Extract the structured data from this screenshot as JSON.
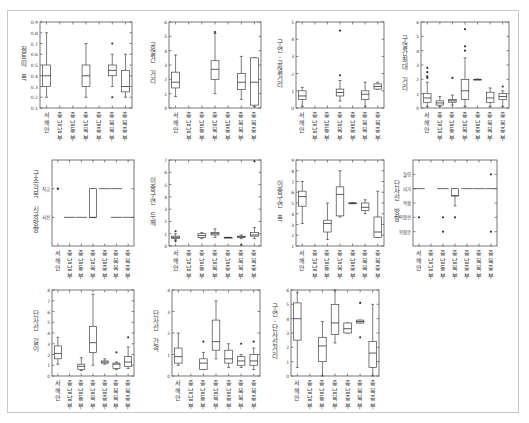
{
  "categories": [
    "서해안",
    "충남남부",
    "충남동부",
    "충남북부",
    "충남중부",
    "충북북부",
    "충북중부"
  ],
  "chart_data": [
    {
      "type": "box",
      "id": "p1",
      "ylabel": "점토띠 폭",
      "ylim": [
        0.1,
        0.9
      ],
      "yticks": [
        0.1,
        0.2,
        0.3,
        0.4,
        0.5,
        0.6,
        0.7,
        0.8,
        0.9
      ],
      "ytick_labels": [
        "0.1",
        "0.2",
        "0.3",
        "0.4",
        "0.5",
        "0.6",
        "0.7",
        "0.8",
        "0.9"
      ],
      "boxes": [
        {
          "cat": 0,
          "min": 0.2,
          "q1": 0.3,
          "med": 0.4,
          "q3": 0.5,
          "max": 0.8,
          "outliers": []
        },
        {
          "cat": 3,
          "min": 0.2,
          "q1": 0.3,
          "med": 0.4,
          "q3": 0.5,
          "max": 0.7,
          "outliers": []
        },
        {
          "cat": 5,
          "min": 0.3,
          "q1": 0.4,
          "med": 0.45,
          "q3": 0.5,
          "max": 0.6,
          "outliers": [
            0.7,
            0.2
          ]
        },
        {
          "cat": 6,
          "min": 0.2,
          "q1": 0.25,
          "med": 0.3,
          "q3": 0.45,
          "max": 0.6,
          "outliers": []
        }
      ]
    },
    {
      "type": "box",
      "id": "p2",
      "ylabel": "공열간 거리",
      "ylim": [
        0,
        6
      ],
      "yticks": [
        0,
        1,
        2,
        3,
        4,
        5,
        6
      ],
      "ytick_labels": [
        "0",
        "1",
        "2",
        "3",
        "4",
        "5",
        "6"
      ],
      "boxes": [
        {
          "cat": 0,
          "min": 0.8,
          "q1": 1.4,
          "med": 1.8,
          "q3": 2.5,
          "max": 3.7,
          "outliers": []
        },
        {
          "cat": 3,
          "min": 1.0,
          "q1": 2.0,
          "med": 2.7,
          "q3": 3.3,
          "max": 5.2,
          "outliers": [
            5.3
          ]
        },
        {
          "cat": 5,
          "min": 0.6,
          "q1": 1.3,
          "med": 1.8,
          "q3": 2.4,
          "max": 3.6,
          "outliers": []
        },
        {
          "cat": 6,
          "min": 0.1,
          "q1": 0.2,
          "med": 1.8,
          "q3": 3.5,
          "max": 3.5,
          "outliers": []
        }
      ]
    },
    {
      "type": "box",
      "id": "p3",
      "ylabel": "구연-공열거리",
      "ylim": [
        0,
        5
      ],
      "yticks": [
        0,
        1,
        2,
        3,
        4,
        5
      ],
      "ytick_labels": [
        "0",
        "1",
        "2",
        "3",
        "4",
        "5"
      ],
      "boxes": [
        {
          "cat": 0,
          "min": 0.1,
          "q1": 0.5,
          "med": 0.7,
          "q3": 1.0,
          "max": 1.2,
          "outliers": []
        },
        {
          "cat": 3,
          "min": 0.4,
          "q1": 0.7,
          "med": 0.9,
          "q3": 1.1,
          "max": 1.6,
          "outliers": [
            1.9,
            4.5
          ]
        },
        {
          "cat": 5,
          "min": 0.1,
          "q1": 0.5,
          "med": 0.8,
          "q3": 1.0,
          "max": 1.5,
          "outliers": []
        },
        {
          "cat": 6,
          "min": 1.1,
          "q1": 1.1,
          "med": 1.25,
          "q3": 1.4,
          "max": 1.5,
          "outliers": []
        }
      ]
    },
    {
      "type": "box",
      "id": "p4",
      "ylabel": "구열간최대 거리",
      "ylim": [
        0,
        6
      ],
      "yticks": [
        0,
        1,
        2,
        3,
        4,
        5,
        6
      ],
      "ytick_labels": [
        "0",
        "1",
        "2",
        "3",
        "4",
        "5",
        "6"
      ],
      "boxes": [
        {
          "cat": 0,
          "min": 0.1,
          "q1": 0.4,
          "med": 0.7,
          "q3": 1.0,
          "max": 1.8,
          "outliers": [
            2.1,
            2.2,
            2.5,
            2.8
          ]
        },
        {
          "cat": 1,
          "min": 0.1,
          "q1": 0.2,
          "med": 0.35,
          "q3": 0.5,
          "max": 0.8,
          "outliers": []
        },
        {
          "cat": 2,
          "min": 0.2,
          "q1": 0.4,
          "med": 0.5,
          "q3": 0.6,
          "max": 0.9,
          "outliers": [
            2.1
          ]
        },
        {
          "cat": 3,
          "min": 0.1,
          "q1": 0.6,
          "med": 1.2,
          "q3": 2.0,
          "max": 3.5,
          "outliers": [
            4.0,
            4.3,
            5.5
          ]
        },
        {
          "cat": 4,
          "min": 2.0,
          "q1": 2.0,
          "med": 2.0,
          "q3": 2.0,
          "max": 2.0,
          "outliers": []
        },
        {
          "cat": 5,
          "min": 0.1,
          "q1": 0.4,
          "med": 0.7,
          "q3": 1.1,
          "max": 1.4,
          "outliers": []
        },
        {
          "cat": 6,
          "min": 0.1,
          "q1": 0.6,
          "med": 0.8,
          "q3": 1.0,
          "max": 1.2,
          "outliers": [
            1.5
          ]
        }
      ]
    },
    {
      "type": "categorical-box",
      "id": "p5",
      "ylabel": "구조각목 시공방향",
      "ylim": [
        0,
        3
      ],
      "yticks": [
        1,
        2
      ],
      "ytick_labels": [
        "사선",
        "직교"
      ],
      "boxes": [
        {
          "cat": 0,
          "min": 2,
          "q1": 2,
          "med": 2,
          "q3": 2,
          "max": 2,
          "outliers": [],
          "point": true
        },
        {
          "cat": 1,
          "min": 1,
          "q1": 1,
          "med": 1,
          "q3": 1,
          "max": 1,
          "dash": true
        },
        {
          "cat": 2,
          "min": 1,
          "q1": 1,
          "med": 1,
          "q3": 1,
          "max": 1,
          "dash": true
        },
        {
          "cat": 3,
          "min": 1,
          "q1": 1,
          "med": 1,
          "q3": 2,
          "max": 2,
          "outliers": []
        },
        {
          "cat": 4,
          "min": 2,
          "q1": 2,
          "med": 2,
          "q3": 2,
          "max": 2,
          "dash": true
        },
        {
          "cat": 5,
          "min": 2,
          "q1": 2,
          "med": 2,
          "q3": 2,
          "max": 2,
          "dash": true
        },
        {
          "cat": 5,
          "min": 1,
          "q1": 1,
          "med": 1,
          "q3": 1,
          "max": 1,
          "dash": true
        },
        {
          "cat": 6,
          "min": 1,
          "q1": 1,
          "med": 1,
          "q3": 1,
          "max": 1,
          "dash": true
        }
      ]
    },
    {
      "type": "box",
      "id": "p6",
      "ylabel": "이중구연 두께",
      "ylim": [
        0,
        7
      ],
      "yticks": [
        0,
        1,
        2,
        3,
        4,
        5,
        6,
        7
      ],
      "ytick_labels": [
        "0",
        "1",
        "2",
        "3",
        "4",
        "5",
        "6",
        "7"
      ],
      "boxes": [
        {
          "cat": 0,
          "min": 0.5,
          "q1": 0.6,
          "med": 0.7,
          "q3": 0.8,
          "max": 1.0,
          "outliers": [
            1.2,
            0.4
          ]
        },
        {
          "cat": 2,
          "min": 0.6,
          "q1": 0.7,
          "med": 0.85,
          "q3": 1.0,
          "max": 1.1,
          "outliers": []
        },
        {
          "cat": 3,
          "min": 0.7,
          "q1": 0.9,
          "med": 1.0,
          "q3": 1.1,
          "max": 1.4,
          "outliers": []
        },
        {
          "cat": 4,
          "min": 0.7,
          "q1": 0.7,
          "med": 0.7,
          "q3": 0.7,
          "max": 0.7,
          "outliers": []
        },
        {
          "cat": 5,
          "min": 0.6,
          "q1": 0.7,
          "med": 0.75,
          "q3": 0.8,
          "max": 0.9,
          "outliers": [
            0.1
          ]
        },
        {
          "cat": 6,
          "min": 0.6,
          "q1": 0.8,
          "med": 0.9,
          "q3": 1.1,
          "max": 1.5,
          "outliers": [
            6.9
          ]
        }
      ]
    },
    {
      "type": "box",
      "id": "p7",
      "ylabel": "이중구연 폭",
      "ylim": [
        1,
        9
      ],
      "yticks": [
        1,
        2,
        3,
        4,
        5,
        6,
        7,
        8,
        9
      ],
      "ytick_labels": [
        "1",
        "2",
        "3",
        "4",
        "5",
        "6",
        "7",
        "8",
        "9"
      ],
      "boxes": [
        {
          "cat": 0,
          "min": 3.1,
          "q1": 4.7,
          "med": 5.6,
          "q3": 6.1,
          "max": 7.0,
          "outliers": []
        },
        {
          "cat": 2,
          "min": 1.6,
          "q1": 2.3,
          "med": 3.1,
          "q3": 3.4,
          "max": 5.0,
          "outliers": []
        },
        {
          "cat": 3,
          "min": 3.7,
          "q1": 3.8,
          "med": 5.8,
          "q3": 6.5,
          "max": 8.0,
          "outliers": []
        },
        {
          "cat": 4,
          "min": 5.0,
          "q1": 5.0,
          "med": 5.0,
          "q3": 5.0,
          "max": 5.0,
          "outliers": []
        },
        {
          "cat": 5,
          "min": 4.0,
          "q1": 4.3,
          "med": 4.6,
          "q3": 5.0,
          "max": 5.3,
          "outliers": []
        },
        {
          "cat": 6,
          "min": 1.8,
          "q1": 1.8,
          "med": 2.3,
          "q3": 3.7,
          "max": 6.1,
          "outliers": []
        }
      ]
    },
    {
      "type": "categorical-box",
      "id": "p8",
      "ylabel": "단사선 방향",
      "ylim": [
        0,
        6
      ],
      "yticks": [
        1,
        2,
        3,
        4,
        5
      ],
      "ytick_labels": [
        "복합분",
        "복합선",
        "복합",
        "이가",
        "돌림"
      ],
      "boxes": [
        {
          "cat": 0,
          "min": 4,
          "q1": 4,
          "med": 4,
          "q3": 4,
          "max": 4,
          "dash": true,
          "outliers": [
            2
          ]
        },
        {
          "cat": 2,
          "min": 4,
          "q1": 4,
          "med": 4,
          "q3": 4,
          "max": 4,
          "dash": true,
          "outliers": [
            2,
            1
          ]
        },
        {
          "cat": 3,
          "min": 2.8,
          "q1": 3.5,
          "med": 3.5,
          "q3": 4.0,
          "max": 4.0,
          "outliers": [
            2
          ]
        },
        {
          "cat": 4,
          "min": 4,
          "q1": 4,
          "med": 4,
          "q3": 4,
          "max": 4,
          "dash": true
        },
        {
          "cat": 5,
          "min": 4,
          "q1": 4,
          "med": 4,
          "q3": 4,
          "max": 4,
          "dash": true
        },
        {
          "cat": 6,
          "min": 4,
          "q1": 4,
          "med": 4,
          "q3": 4,
          "max": 4,
          "dash": true,
          "outliers": [
            5,
            1
          ]
        }
      ]
    },
    {
      "type": "box",
      "id": "p9",
      "ylabel": "단사선 길이",
      "ylim": [
        0,
        8
      ],
      "yticks": [
        0,
        1,
        2,
        3,
        4,
        5,
        6,
        7,
        8
      ],
      "ytick_labels": [
        "0",
        "1",
        "2",
        "3",
        "4",
        "5",
        "6",
        "7",
        "8"
      ],
      "boxes": [
        {
          "cat": 0,
          "min": 1.1,
          "q1": 1.6,
          "med": 2.1,
          "q3": 2.8,
          "max": 3.6,
          "outliers": []
        },
        {
          "cat": 2,
          "min": 0.5,
          "q1": 0.6,
          "med": 0.9,
          "q3": 1.1,
          "max": 1.7,
          "outliers": []
        },
        {
          "cat": 3,
          "min": 1.0,
          "q1": 2.2,
          "med": 3.1,
          "q3": 4.6,
          "max": 7.6,
          "outliers": []
        },
        {
          "cat": 4,
          "min": 1.1,
          "q1": 1.2,
          "med": 1.3,
          "q3": 1.4,
          "max": 1.6,
          "outliers": []
        },
        {
          "cat": 5,
          "min": 0.6,
          "q1": 0.7,
          "med": 1.1,
          "q3": 1.2,
          "max": 1.3,
          "outliers": [
            2.2
          ]
        },
        {
          "cat": 6,
          "min": 0.7,
          "q1": 0.9,
          "med": 1.3,
          "q3": 1.8,
          "max": 2.7,
          "outliers": [
            3.6
          ]
        }
      ]
    },
    {
      "type": "box",
      "id": "p10",
      "ylabel": "단사선 간격",
      "ylim": [
        0,
        4
      ],
      "yticks": [
        0,
        1,
        2,
        3,
        4
      ],
      "ytick_labels": [
        "0",
        "1",
        "2",
        "3",
        "4"
      ],
      "boxes": [
        {
          "cat": 0,
          "min": 0.5,
          "q1": 0.6,
          "med": 0.9,
          "q3": 1.3,
          "max": 2.0,
          "outliers": []
        },
        {
          "cat": 2,
          "min": 0.3,
          "q1": 0.3,
          "med": 0.6,
          "q3": 0.8,
          "max": 1.1,
          "outliers": [
            1.6
          ]
        },
        {
          "cat": 3,
          "min": 0.8,
          "q1": 1.2,
          "med": 1.6,
          "q3": 2.6,
          "max": 3.5,
          "outliers": []
        },
        {
          "cat": 4,
          "min": 0.4,
          "q1": 0.6,
          "med": 0.8,
          "q3": 1.2,
          "max": 1.5,
          "outliers": []
        },
        {
          "cat": 5,
          "min": 0.4,
          "q1": 0.5,
          "med": 0.7,
          "q3": 0.9,
          "max": 1.0,
          "outliers": [
            1.5
          ]
        },
        {
          "cat": 6,
          "min": 0.3,
          "q1": 0.5,
          "med": 0.7,
          "q3": 1.0,
          "max": 1.3,
          "outliers": [
            1.6
          ]
        }
      ]
    },
    {
      "type": "box",
      "id": "p11",
      "ylabel": "구연-단사선거리",
      "ylim": [
        0,
        6
      ],
      "yticks": [
        0,
        1,
        2,
        3,
        4,
        5,
        6
      ],
      "ytick_labels": [
        "0",
        "1",
        "2",
        "3",
        "4",
        "5",
        "6"
      ],
      "boxes": [
        {
          "cat": 0,
          "min": 0.6,
          "q1": 2.5,
          "med": 4.0,
          "q3": 5.1,
          "max": 5.8,
          "outliers": []
        },
        {
          "cat": 2,
          "min": 0.0,
          "q1": 1.0,
          "med": 2.1,
          "q3": 2.7,
          "max": 3.8,
          "outliers": []
        },
        {
          "cat": 3,
          "min": 2.3,
          "q1": 2.9,
          "med": 3.7,
          "q3": 5.0,
          "max": 6.0,
          "outliers": []
        },
        {
          "cat": 4,
          "min": 3.0,
          "q1": 3.0,
          "med": 3.3,
          "q3": 3.7,
          "max": 3.7,
          "outliers": []
        },
        {
          "cat": 5,
          "min": 3.7,
          "q1": 3.7,
          "med": 3.8,
          "q3": 3.9,
          "max": 3.9,
          "outliers": [
            5.1,
            2.7
          ]
        },
        {
          "cat": 6,
          "min": 0.0,
          "q1": 0.6,
          "med": 1.6,
          "q3": 2.4,
          "max": 5.0,
          "outliers": []
        }
      ]
    }
  ],
  "layout": {
    "panels": [
      {
        "left": 40,
        "top": 22,
        "w": 92,
        "h": 86
      },
      {
        "left": 169,
        "top": 22,
        "w": 92,
        "h": 86
      },
      {
        "left": 296,
        "top": 22,
        "w": 88,
        "h": 86
      },
      {
        "left": 421,
        "top": 22,
        "w": 88,
        "h": 86
      },
      {
        "left": 52,
        "top": 160,
        "w": 82,
        "h": 86
      },
      {
        "left": 169,
        "top": 160,
        "w": 92,
        "h": 86
      },
      {
        "left": 296,
        "top": 160,
        "w": 88,
        "h": 86
      },
      {
        "left": 413,
        "top": 160,
        "w": 84,
        "h": 86
      },
      {
        "left": 52,
        "top": 290,
        "w": 82,
        "h": 86
      },
      {
        "left": 172,
        "top": 290,
        "w": 88,
        "h": 86
      },
      {
        "left": 291,
        "top": 290,
        "w": 88,
        "h": 86
      }
    ]
  }
}
